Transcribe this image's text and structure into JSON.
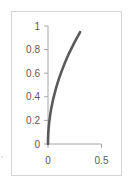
{
  "chart_data": {
    "type": "line",
    "title": "",
    "xlabel": "",
    "ylabel": "",
    "xlim": [
      0,
      0.5
    ],
    "ylim": [
      0,
      1
    ],
    "x_ticks": [
      "0",
      "0.5"
    ],
    "y_ticks": [
      "0",
      "0.2",
      "0.4",
      "0.6",
      "0.8",
      "1"
    ],
    "grid": false,
    "legend": null,
    "series": [
      {
        "name": "Series1",
        "color": "#595959",
        "x": [
          0,
          0.0005,
          0.002,
          0.005,
          0.01,
          0.02,
          0.03,
          0.05,
          0.075,
          0.1,
          0.13,
          0.16,
          0.2,
          0.25,
          0.3
        ],
        "y": [
          0,
          0.039,
          0.077,
          0.122,
          0.173,
          0.245,
          0.3,
          0.387,
          0.474,
          0.548,
          0.624,
          0.693,
          0.775,
          0.866,
          0.949
        ]
      }
    ]
  },
  "colors": {
    "line": "#595959",
    "axis": "#a6a6a6",
    "border": "#d4d4d4",
    "text": "#595959"
  }
}
